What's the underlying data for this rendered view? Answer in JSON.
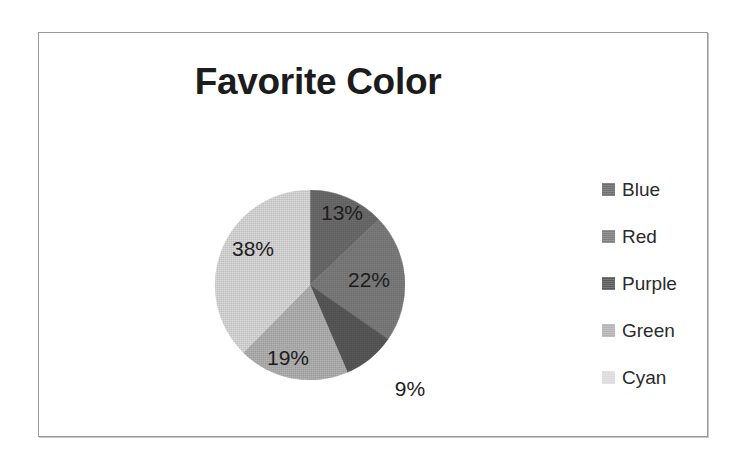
{
  "chart_data": {
    "type": "pie",
    "title": "Favorite Color",
    "xlabel": "",
    "ylabel": "",
    "legend_position": "right",
    "grid": false,
    "start_angle_clock": "12 o'clock",
    "direction": "clockwise",
    "categories": [
      "Blue",
      "Red",
      "Purple",
      "Green",
      "Cyan"
    ],
    "values": [
      13,
      22,
      9,
      19,
      38
    ],
    "value_unit": "%",
    "labels": [
      "13%",
      "22%",
      "9%",
      "19%",
      "38%"
    ],
    "colors": [
      "#6d6d6d",
      "#7e7e7e",
      "#5a5a5a",
      "#b4b4b4",
      "#dcdcdc"
    ],
    "slices": [
      {
        "name": "Blue",
        "value": 13,
        "label": "13%",
        "color": "#6d6d6d",
        "label_inside": true,
        "label_x": 342,
        "label_y": 213
      },
      {
        "name": "Red",
        "value": 22,
        "label": "22%",
        "color": "#7e7e7e",
        "label_inside": true,
        "label_x": 369,
        "label_y": 280
      },
      {
        "name": "Purple",
        "value": 9,
        "label": "9%",
        "color": "#5a5a5a",
        "label_inside": false,
        "label_x": 410,
        "label_y": 389
      },
      {
        "name": "Green",
        "value": 19,
        "label": "19%",
        "color": "#b4b4b4",
        "label_inside": true,
        "label_x": 288,
        "label_y": 358
      },
      {
        "name": "Cyan",
        "value": 38,
        "label": "38%",
        "color": "#dcdcdc",
        "label_inside": true,
        "label_x": 253,
        "label_y": 249
      }
    ]
  },
  "chart": {
    "title": "Favorite Color"
  },
  "legend": {
    "items": [
      {
        "label": "Blue",
        "color": "#6d6d6d"
      },
      {
        "label": "Red",
        "color": "#7e7e7e"
      },
      {
        "label": "Purple",
        "color": "#5a5a5a"
      },
      {
        "label": "Green",
        "color": "#b4b4b4"
      },
      {
        "label": "Cyan",
        "color": "#dcdcdc"
      }
    ]
  }
}
